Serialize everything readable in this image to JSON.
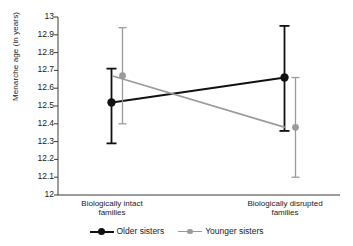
{
  "chart_data": {
    "type": "line",
    "title": "",
    "xlabel": "",
    "ylabel": "Menarche age (in years)",
    "categories": [
      "Biologically intact families",
      "Biologically disrupted families"
    ],
    "category_lines": [
      [
        "Biologically intact",
        "families"
      ],
      [
        "Biologically disrupted",
        "families"
      ]
    ],
    "ylim": [
      12,
      13
    ],
    "ytick_labels": [
      "13",
      "12.9",
      "12.8",
      "12.7",
      "12.6",
      "12.5",
      "12.4",
      "12.3",
      "12.2",
      "12.1",
      "12"
    ],
    "ytick_values": [
      13,
      12.9,
      12.8,
      12.7,
      12.6,
      12.5,
      12.4,
      12.3,
      12.2,
      12.1,
      12
    ],
    "grid": false,
    "legend_position": "bottom",
    "series": [
      {
        "name": "Older sisters",
        "color": "#111111",
        "values": [
          12.52,
          12.66
        ],
        "error_low": [
          12.29,
          12.36
        ],
        "error_high": [
          12.71,
          12.95
        ]
      },
      {
        "name": "Younger sisters",
        "color": "#9a9a9a",
        "values": [
          12.67,
          12.38
        ],
        "error_low": [
          12.4,
          12.1
        ],
        "error_high": [
          12.94,
          12.66
        ]
      }
    ]
  },
  "axis": {
    "y_title": "Menarche age (in years)"
  },
  "legend": {
    "items": [
      {
        "label": "Older sisters",
        "color": "#111111"
      },
      {
        "label": "Younger sisters",
        "color": "#9a9a9a"
      }
    ]
  }
}
